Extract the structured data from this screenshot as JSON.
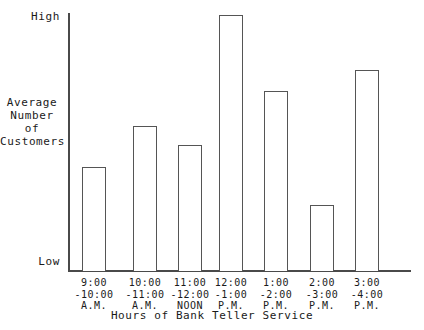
{
  "chart_data": {
    "type": "bar",
    "title": "",
    "xlabel": "Hours of Bank Teller Service",
    "ylabel": "Average Number of Customers",
    "categories": [
      "9:00 -10:00 A.M.",
      "10:00 -11:00 A.M.",
      "11:00 -12:00 NOON",
      "12:00 -1:00 P.M.",
      "1:00 -2:00 P.M.",
      "2:00 -3:00 P.M.",
      "3:00 -4:00 P.M."
    ],
    "values": [
      0.41,
      0.57,
      0.49,
      1.0,
      0.7,
      0.26,
      0.78
    ],
    "ylim": [
      0,
      1
    ],
    "y_tick_labels": [
      "Low",
      "High"
    ],
    "grid": false,
    "legend": false,
    "bar_style": {
      "fill": "#ffffff",
      "stroke": "#555555",
      "stroke_width": 1
    }
  },
  "axes": {
    "y": {
      "high_label": "High",
      "low_label": "Low",
      "title_lines": [
        "Average",
        "Number",
        "of",
        "Customers"
      ],
      "line_color": "#4a4a4a"
    },
    "x": {
      "title": "Hours of Bank Teller Service",
      "line_color": "#4a4a4a",
      "ticks": [
        {
          "line1": "9:00",
          "line2": "-10:00",
          "line3": "A.M."
        },
        {
          "line1": "10:00",
          "line2": "-11:00",
          "line3": "A.M."
        },
        {
          "line1": "11:00",
          "line2": "-12:00",
          "line3": "NOON"
        },
        {
          "line1": "12:00",
          "line2": "-1:00",
          "line3": "P.M."
        },
        {
          "line1": "1:00",
          "line2": "-2:00",
          "line3": "P.M."
        },
        {
          "line1": "2:00",
          "line2": "-3:00",
          "line3": "P.M."
        },
        {
          "line1": "3:00",
          "line2": "-4:00",
          "line3": "P.M."
        }
      ]
    }
  },
  "bars": [
    {
      "label": "9:00 -10:00 A.M.",
      "left": 82,
      "width": 24,
      "top": 167,
      "height": 104
    },
    {
      "label": "10:00 -11:00 A.M.",
      "left": 133,
      "width": 24,
      "top": 126,
      "height": 145
    },
    {
      "label": "11:00 -12:00 NOON",
      "left": 178,
      "width": 24,
      "top": 145,
      "height": 126
    },
    {
      "label": "12:00 -1:00 P.M.",
      "left": 219,
      "width": 24,
      "top": 15,
      "height": 256
    },
    {
      "label": "1:00 -2:00 P.M.",
      "left": 264,
      "width": 24,
      "top": 91,
      "height": 180
    },
    {
      "label": "2:00 -3:00 P.M.",
      "left": 310,
      "width": 24,
      "top": 205,
      "height": 66
    },
    {
      "label": "3:00 -4:00 P.M.",
      "left": 355,
      "width": 24,
      "top": 70,
      "height": 201
    }
  ],
  "tick_positions": [
    {
      "left": 62,
      "width": 64
    },
    {
      "left": 113,
      "width": 64
    },
    {
      "left": 158,
      "width": 64
    },
    {
      "left": 199,
      "width": 64
    },
    {
      "left": 244,
      "width": 64
    },
    {
      "left": 290,
      "width": 64
    },
    {
      "left": 335,
      "width": 64
    }
  ]
}
